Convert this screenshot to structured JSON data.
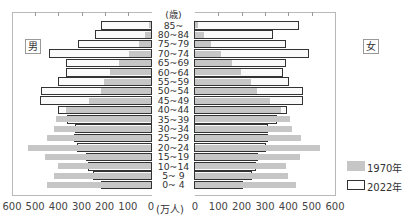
{
  "chart_data": {
    "type": "bar",
    "subtype": "population-pyramid",
    "title": "",
    "unit_label": "(万人)",
    "age_axis_label": "(歳)",
    "left_label": "男",
    "right_label": "女",
    "categories": [
      "85~",
      "80~84",
      "75~79",
      "70~74",
      "65~69",
      "60~64",
      "55~59",
      "50~54",
      "45~49",
      "40~44",
      "35~39",
      "30~34",
      "25~29",
      "20~24",
      "15~19",
      "10~14",
      "5~ 9",
      "0~ 4"
    ],
    "xlim": [
      0,
      600
    ],
    "x_ticks_left": [
      "600",
      "500",
      "400",
      "300",
      "200",
      "100",
      "0"
    ],
    "x_ticks_right": [
      "0",
      "100",
      "200",
      "300",
      "400",
      "500",
      "600"
    ],
    "grid": false,
    "legend_position": "right-bottom",
    "series": [
      {
        "name": "1970年",
        "sex": "male",
        "values": [
          13,
          30,
          56,
          99,
          142,
          181,
          207,
          220,
          272,
          371,
          414,
          422,
          453,
          534,
          461,
          405,
          422,
          453
        ]
      },
      {
        "name": "2022年",
        "sex": "male",
        "values": [
          216,
          241,
          315,
          440,
          366,
          366,
          401,
          474,
          478,
          401,
          362,
          328,
          332,
          319,
          280,
          272,
          250,
          216
        ]
      },
      {
        "name": "1970年",
        "sex": "female",
        "values": [
          17,
          39,
          73,
          116,
          163,
          202,
          245,
          270,
          326,
          373,
          412,
          421,
          459,
          541,
          455,
          395,
          404,
          438
        ]
      },
      {
        "name": "2022年",
        "sex": "female",
        "values": [
          447,
          335,
          391,
          494,
          391,
          378,
          404,
          468,
          468,
          395,
          356,
          313,
          313,
          305,
          270,
          262,
          245,
          206
        ]
      }
    ],
    "colors": {
      "s1970": "#c6c6c6",
      "s2022": "#fafafa",
      "outline": "#333333"
    }
  },
  "labels": {
    "age_unit": "(歳)",
    "value_unit": "(万人)",
    "male": "男",
    "female": "女"
  },
  "legend": [
    {
      "label": "1970年",
      "style": "gray-fill"
    },
    {
      "label": "2022年",
      "style": "white-outline"
    }
  ]
}
